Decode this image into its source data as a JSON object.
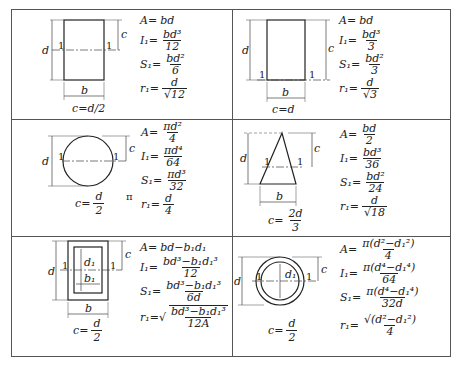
{
  "cells": [
    {
      "shape": "rectangle-centroid-axis",
      "c_label": "c=d/2",
      "dim_labels": {
        "height": "d",
        "width": "b",
        "c": "c",
        "axis": "1"
      },
      "formulas": {
        "A": {
          "lhs": "A=",
          "rhs": "bd"
        },
        "I": {
          "lhs": "I₁=",
          "num": "bd³",
          "den": "12"
        },
        "S": {
          "lhs": "S₁=",
          "num": "bd²",
          "den": "6"
        },
        "r": {
          "lhs": "r₁=",
          "num": "d",
          "den": "√12"
        }
      }
    },
    {
      "shape": "rectangle-base-axis",
      "c_label": "c=d",
      "dim_labels": {
        "height": "d",
        "width": "b",
        "c": "c",
        "axis": "1"
      },
      "formulas": {
        "A": {
          "lhs": "A=",
          "rhs": "bd"
        },
        "I": {
          "lhs": "I₁=",
          "num": "bd³",
          "den": "3"
        },
        "S": {
          "lhs": "S₁=",
          "num": "bd²",
          "den": "3"
        },
        "r": {
          "lhs": "r₁=",
          "num": "d",
          "den": "√3"
        }
      }
    },
    {
      "shape": "circle",
      "c_label_lhs": "c=",
      "c_label_num": "d",
      "c_label_den": "2",
      "pi_note": "π",
      "dim_labels": {
        "height": "d",
        "c": "c",
        "axis": "1"
      },
      "formulas": {
        "A": {
          "lhs": "A=",
          "num": "πd²",
          "den": "4"
        },
        "I": {
          "lhs": "I₁=",
          "num": "πd⁴",
          "den": "64"
        },
        "S": {
          "lhs": "S₁=",
          "num": "πd³",
          "den": "32"
        },
        "r": {
          "lhs": "r₁=",
          "num": "d",
          "den": "4"
        }
      }
    },
    {
      "shape": "triangle",
      "c_label_lhs": "c=",
      "c_label_num": "2d",
      "c_label_den": "3",
      "dim_labels": {
        "height": "d",
        "width": "b",
        "c": "c",
        "axis": "1"
      },
      "formulas": {
        "A": {
          "lhs": "A=",
          "num": "bd",
          "den": "2"
        },
        "I": {
          "lhs": "I₁=",
          "num": "bd³",
          "den": "36"
        },
        "S": {
          "lhs": "S₁=",
          "num": "bd²",
          "den": "24"
        },
        "r": {
          "lhs": "r₁=",
          "num": "d",
          "den": "√18"
        }
      }
    },
    {
      "shape": "hollow-rectangle",
      "c_label_lhs": "c=",
      "c_label_num": "d",
      "c_label_den": "2",
      "dim_labels": {
        "height": "d",
        "width": "b",
        "inner_height": "d₁",
        "inner_width": "b₁",
        "c": "c",
        "axis": "1"
      },
      "formulas": {
        "A": {
          "lhs": "A=",
          "rhs": "bd−b₁d₁"
        },
        "I": {
          "lhs": "I₁=",
          "num": "bd³−b₁d₁³",
          "den": "12"
        },
        "S": {
          "lhs": "S₁=",
          "num": "bd³−b₁d₁³",
          "den": "6d"
        },
        "r": {
          "lhs": "r₁=√",
          "num": "bd³−b₁d₁³",
          "den": "12A"
        }
      }
    },
    {
      "shape": "hollow-circle",
      "c_label_lhs": "c=",
      "c_label_num": "d",
      "c_label_den": "2",
      "dim_labels": {
        "height": "d",
        "inner_diameter": "d₁",
        "c": "c",
        "axis": "1"
      },
      "formulas": {
        "A": {
          "lhs": "A=",
          "num": "π(d²−d₁²)",
          "den": "4"
        },
        "I": {
          "lhs": "I₁=",
          "num": "π(d⁴−d₁⁴)",
          "den": "64"
        },
        "S": {
          "lhs": "S₁=",
          "num": "π(d⁴−d₁⁴)",
          "den": "32d"
        },
        "r": {
          "lhs": "r₁=",
          "num": "√(d²−d₁²)",
          "den": "4"
        }
      }
    }
  ]
}
